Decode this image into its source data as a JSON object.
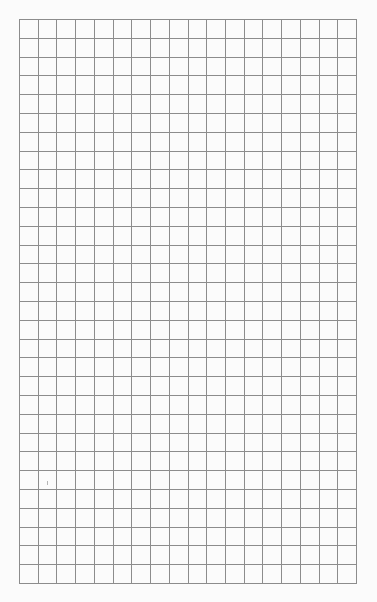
{
  "page": {
    "type": "graph-paper",
    "background_color": "#fbfbfb",
    "line_color": "#8c8c8c"
  },
  "grid": {
    "left": 19,
    "top": 19,
    "width": 338,
    "height": 565,
    "columns": 18,
    "rows": 30,
    "cell_size": 18.8,
    "line_width": 1
  },
  "marks": [
    {
      "x": 47,
      "y": 481,
      "height": 4
    }
  ]
}
